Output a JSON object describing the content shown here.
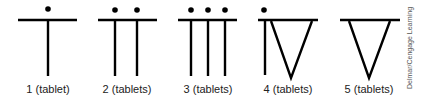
{
  "figure": {
    "stroke_color": "#000000",
    "symbols": [
      {
        "id": 1,
        "label": "1 (tablet)",
        "dots": 1,
        "stems": 1,
        "triangle": false,
        "cx": 48
      },
      {
        "id": 2,
        "label": "2 (tablets)",
        "dots": 2,
        "stems": 2,
        "triangle": false,
        "cx": 127
      },
      {
        "id": 3,
        "label": "3 (tablets)",
        "dots": 3,
        "stems": 3,
        "triangle": false,
        "cx": 208
      },
      {
        "id": 4,
        "label": "4 (tablets)",
        "dots": 1,
        "stems": 1,
        "triangle": true,
        "cx": 288
      },
      {
        "id": 5,
        "label": "5 (tablets)",
        "dots": 0,
        "stems": 0,
        "triangle": true,
        "cx": 369
      }
    ],
    "credit": "Delmar/Cengage Learning"
  }
}
